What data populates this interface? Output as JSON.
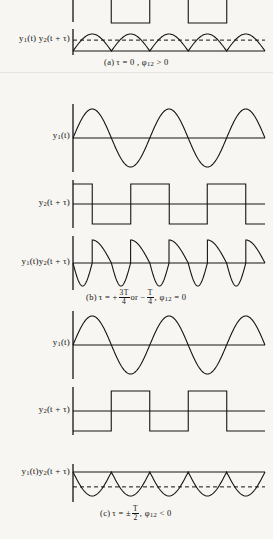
{
  "figure": {
    "background_color": "#f7f6f2",
    "ink_color": "#141414",
    "panels": [
      {
        "id": "a",
        "caption": "(a) τ = 0 , ϕ",
        "caption_sub": "12",
        "caption_tail": " > 0",
        "rows": [
          {
            "id": "a-square-top",
            "label": "",
            "type": "square-wave-clipped"
          },
          {
            "id": "a-product",
            "label_y1": "y",
            "label_sub1": "1",
            "label_mid": "(t) y",
            "label_sub2": "2",
            "label_tail": "(t + τ)",
            "type": "rectified-sine-positive",
            "dashed_mean": true
          }
        ]
      },
      {
        "id": "b",
        "caption_lead": "(b) τ = + ",
        "caption_frac1_num": "3T",
        "caption_frac1_den": "4",
        "caption_mid": " or − ",
        "caption_frac2_num": "T",
        "caption_frac2_den": "4",
        "caption_sub_lead": " , ϕ",
        "caption_sub": "12",
        "caption_tail": " = 0",
        "rows": [
          {
            "id": "b-sine",
            "label_y1": "y",
            "label_sub1": "1",
            "label_tail": "(t)",
            "type": "sine"
          },
          {
            "id": "b-square",
            "label_y1": "y",
            "label_sub1": "2",
            "label_tail": "(t + τ)",
            "type": "square-wave",
            "phase": "quarter"
          },
          {
            "id": "b-product",
            "label_y1": "y",
            "label_sub1": "1",
            "label_mid": "(t)y",
            "label_sub2": "2",
            "label_tail": "(t + τ)",
            "type": "sawtooth-product",
            "dashed_mean": false
          }
        ]
      },
      {
        "id": "c",
        "caption_lead": "(c) τ = ± ",
        "caption_frac1_num": "T",
        "caption_frac1_den": "2",
        "caption_sub_lead": " , ϕ",
        "caption_sub": "12",
        "caption_tail": " < 0",
        "rows": [
          {
            "id": "c-sine",
            "label_y1": "y",
            "label_sub1": "1",
            "label_tail": "(t)",
            "type": "sine"
          },
          {
            "id": "c-square",
            "label_y1": "y",
            "label_sub1": "2",
            "label_tail": "(t + τ)",
            "type": "square-wave",
            "phase": "half"
          },
          {
            "id": "c-product",
            "label_y1": "y",
            "label_sub1": "1",
            "label_mid": "(t)y",
            "label_sub2": "2",
            "label_tail": "(t + τ)",
            "type": "rectified-sine-negative",
            "dashed_mean": true
          }
        ]
      }
    ]
  },
  "chart_data": {
    "type": "line",
    "title": "",
    "xlabel": "",
    "ylabel": "",
    "cycles_shown": 2.5,
    "axis_x_start": 73,
    "axis_x_end": 265,
    "panels": [
      {
        "name": "a",
        "tau": "0",
        "phi12": "> 0",
        "series": [
          {
            "name": "y2(t+τ) (clipped top)",
            "type": "square",
            "amplitude": 1,
            "cycles": 2.5,
            "phase_fraction": 0.0
          },
          {
            "name": "y1(t)y2(t+τ)",
            "type": "rectified-sine",
            "sign": "positive",
            "amplitude": 1,
            "humps": 5,
            "mean_level": 0.64
          }
        ]
      },
      {
        "name": "b",
        "tau": "+3T/4 or -T/4",
        "phi12": "= 0",
        "series": [
          {
            "name": "y1(t)",
            "type": "sine",
            "amplitude": 1,
            "cycles": 2.5,
            "phase_fraction": 0.0
          },
          {
            "name": "y2(t+τ)",
            "type": "square",
            "amplitude": 1,
            "cycles": 2.5,
            "phase_fraction": 0.25
          },
          {
            "name": "y1(t)y2(t+τ)",
            "type": "sawtooth-product",
            "amplitude": 1,
            "periods": 5,
            "mean_level": 0.0
          }
        ]
      },
      {
        "name": "c",
        "tau": "±T/2",
        "phi12": "< 0",
        "series": [
          {
            "name": "y1(t)",
            "type": "sine",
            "amplitude": 1,
            "cycles": 2.5,
            "phase_fraction": 0.0
          },
          {
            "name": "y2(t+τ)",
            "type": "square",
            "amplitude": 1,
            "cycles": 2.5,
            "phase_fraction": 0.5
          },
          {
            "name": "y1(t)y2(t+τ)",
            "type": "rectified-sine",
            "sign": "negative",
            "amplitude": 1,
            "humps": 5,
            "mean_level": -0.64
          }
        ]
      }
    ]
  }
}
